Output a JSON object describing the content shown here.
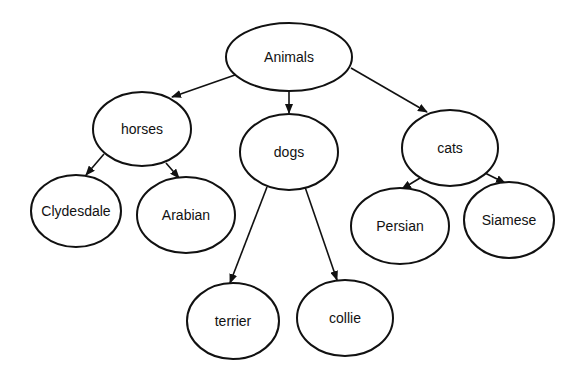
{
  "diagram": {
    "type": "tree",
    "colors": {
      "stroke": "#111111",
      "background": "#ffffff",
      "node_fill": "#ffffff"
    },
    "nodes": [
      {
        "id": "animals",
        "label": "Animals",
        "cx": 289,
        "cy": 57,
        "rx": 63,
        "ry": 34
      },
      {
        "id": "horses",
        "label": "horses",
        "cx": 142,
        "cy": 129,
        "rx": 49,
        "ry": 37
      },
      {
        "id": "dogs",
        "label": "dogs",
        "cx": 289,
        "cy": 152,
        "rx": 49,
        "ry": 38
      },
      {
        "id": "cats",
        "label": "cats",
        "cx": 450,
        "cy": 148,
        "rx": 48,
        "ry": 38
      },
      {
        "id": "clydesdale",
        "label": "Clydesdale",
        "cx": 76,
        "cy": 211,
        "rx": 45,
        "ry": 36
      },
      {
        "id": "arabian",
        "label": "Arabian",
        "cx": 186,
        "cy": 215,
        "rx": 49,
        "ry": 38
      },
      {
        "id": "persian",
        "label": "Persian",
        "cx": 400,
        "cy": 226,
        "rx": 49,
        "ry": 38
      },
      {
        "id": "siamese",
        "label": "Siamese",
        "cx": 509,
        "cy": 220,
        "rx": 45,
        "ry": 38
      },
      {
        "id": "terrier",
        "label": "terrier",
        "cx": 233,
        "cy": 321,
        "rx": 46,
        "ry": 38
      },
      {
        "id": "collie",
        "label": "collie",
        "cx": 345,
        "cy": 318,
        "rx": 48,
        "ry": 38
      }
    ],
    "edges": [
      {
        "from": "animals",
        "to": "horses",
        "x1": 235,
        "y1": 75,
        "x2": 172,
        "y2": 97
      },
      {
        "from": "animals",
        "to": "dogs",
        "x1": 289,
        "y1": 91,
        "x2": 289,
        "y2": 113
      },
      {
        "from": "animals",
        "to": "cats",
        "x1": 351,
        "y1": 68,
        "x2": 427,
        "y2": 112
      },
      {
        "from": "horses",
        "to": "clydesdale",
        "x1": 104,
        "y1": 154,
        "x2": 86,
        "y2": 175
      },
      {
        "from": "horses",
        "to": "arabian",
        "x1": 166,
        "y1": 163,
        "x2": 179,
        "y2": 178
      },
      {
        "from": "dogs",
        "to": "terrier",
        "x1": 267,
        "y1": 187,
        "x2": 230,
        "y2": 283
      },
      {
        "from": "dogs",
        "to": "collie",
        "x1": 305,
        "y1": 187,
        "x2": 337,
        "y2": 280
      },
      {
        "from": "cats",
        "to": "persian",
        "x1": 420,
        "y1": 178,
        "x2": 402,
        "y2": 189
      },
      {
        "from": "cats",
        "to": "siamese",
        "x1": 485,
        "y1": 173,
        "x2": 505,
        "y2": 183
      }
    ]
  }
}
